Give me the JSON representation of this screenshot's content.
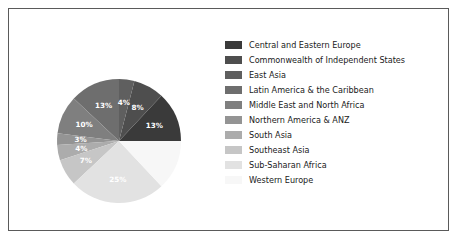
{
  "figure": {
    "background": "#ffffff",
    "border_color": "#5a5a5a"
  },
  "chart_data": {
    "type": "pie",
    "title": "",
    "start_angle_deg": 0,
    "direction": "counterclockwise",
    "label_color": "#ffffff",
    "categories": [
      "Central and Eastern Europe",
      "Commonwealth of Independent States",
      "East Asia",
      "Latin America & the Caribbean",
      "Middle East and North Africa",
      "Northern America & ANZ",
      "South Asia",
      "Southeast Asia",
      "Sub-Saharan Africa",
      "Western Europe"
    ],
    "values": [
      13,
      8,
      4,
      13,
      10,
      3,
      4,
      7,
      25,
      13
    ],
    "labels": [
      "13%",
      "8%",
      "4%",
      "13%",
      "10%",
      "3%",
      "4%",
      "7%",
      "25%",
      "13%"
    ],
    "label_visible": [
      true,
      true,
      true,
      true,
      true,
      true,
      true,
      true,
      true,
      false
    ],
    "colors": [
      "#3a3a3a",
      "#4e4e4e",
      "#5f5f5f",
      "#6e6e6e",
      "#7f7f7f",
      "#949494",
      "#acacac",
      "#c6c6c6",
      "#e2e2e2",
      "#f7f7f7"
    ],
    "legend_position": "right"
  }
}
